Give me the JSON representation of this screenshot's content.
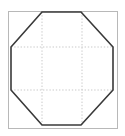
{
  "figure": {
    "type": "geometric-diagram",
    "background_color": "#ffffff",
    "canvas": {
      "width": 125,
      "height": 136
    },
    "outer_square": {
      "name": "bounding-square",
      "stroke_color": "#b8b8b8",
      "stroke_width": 1,
      "fill": "none",
      "x": 8.5,
      "y": 11.5,
      "width": 109,
      "height": 117
    },
    "octagon": {
      "name": "octagon",
      "stroke_color": "#3a3a3a",
      "stroke_width": 1.6,
      "fill": "none",
      "sides": 8,
      "points": "42,12 81,12 113,47 113,90 81,125 42,125 11,90 11,47",
      "vertices": [
        {
          "label": "top-left",
          "x": 42,
          "y": 12
        },
        {
          "label": "top-right",
          "x": 81,
          "y": 12
        },
        {
          "label": "right-top",
          "x": 113,
          "y": 47
        },
        {
          "label": "right-bottom",
          "x": 113,
          "y": 90
        },
        {
          "label": "bottom-right",
          "x": 81,
          "y": 125
        },
        {
          "label": "bottom-left",
          "x": 42,
          "y": 125
        },
        {
          "label": "left-bottom",
          "x": 11,
          "y": 90
        },
        {
          "label": "left-top",
          "x": 11,
          "y": 47
        }
      ]
    },
    "grid": {
      "name": "construction-grid",
      "stroke_color": "#c9c9c9",
      "stroke_width": 1,
      "dash_pattern": "1.4,1.8",
      "vertical_lines": [
        {
          "label": "grid-v-left",
          "x": 42,
          "y1": 12,
          "y2": 125
        },
        {
          "label": "grid-v-right",
          "x": 82,
          "y1": 12,
          "y2": 125
        }
      ],
      "horizontal_lines": [
        {
          "label": "grid-h-top",
          "y": 47,
          "x1": 11,
          "x2": 114
        },
        {
          "label": "grid-h-bottom",
          "y": 90,
          "x1": 11,
          "x2": 114
        }
      ]
    },
    "chamfers": {
      "name": "corner-chamfers",
      "stroke_color": "#cfcfcf",
      "stroke_width": 1,
      "description": "faint light diagonals echoing the cut corners",
      "segments": [
        {
          "label": "chamfer-top-left",
          "x1": 11,
          "y1": 47,
          "x2": 42,
          "y2": 12
        },
        {
          "label": "chamfer-top-right",
          "x1": 81,
          "y1": 12,
          "x2": 113,
          "y2": 47
        },
        {
          "label": "chamfer-bottom-right",
          "x1": 113,
          "y1": 90,
          "x2": 81,
          "y2": 125
        },
        {
          "label": "chamfer-bottom-left",
          "x1": 42,
          "y1": 125,
          "x2": 11,
          "y2": 90
        }
      ]
    }
  }
}
